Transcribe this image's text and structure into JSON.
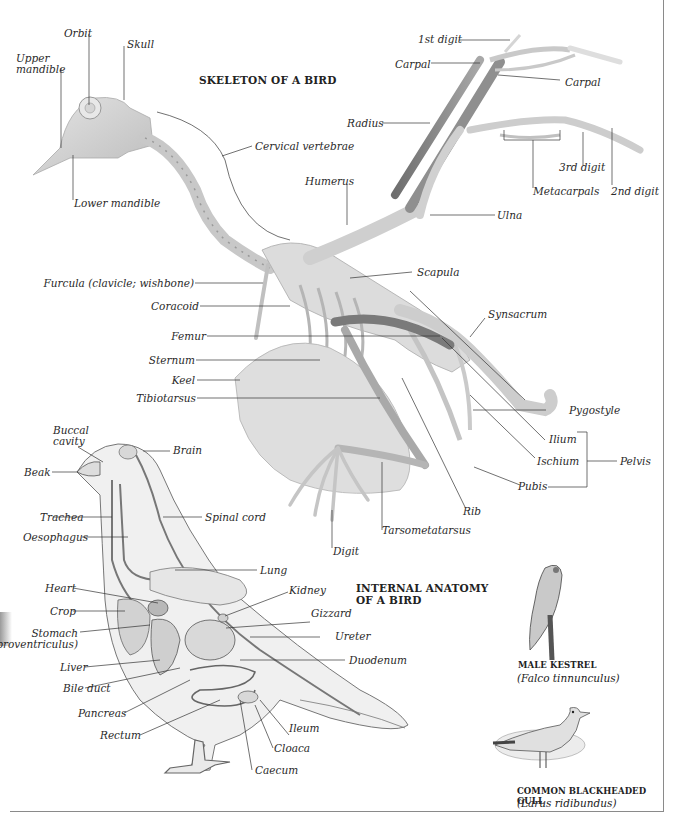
{
  "skeleton": {
    "title": "SKELETON OF A BIRD",
    "labels": {
      "orbit": "Orbit",
      "skull": "Skull",
      "upper_mandible_1": "Upper",
      "upper_mandible_2": "mandible",
      "lower_mandible": "Lower mandible",
      "cervical_vertebrae": "Cervical vertebrae",
      "humerus": "Humerus",
      "first_digit": "1st digit",
      "carpal_left": "Carpal",
      "carpal_right": "Carpal",
      "radius": "Radius",
      "third_digit": "3rd digit",
      "metacarpals": "Metacarpals",
      "second_digit": "2nd digit",
      "ulna": "Ulna",
      "furcula": "Furcula (clavicle; wishbone)",
      "coracoid": "Coracoid",
      "scapula": "Scapula",
      "synsacrum": "Synsacrum",
      "femur": "Femur",
      "sternum": "Sternum",
      "keel": "Keel",
      "tibiotarsus": "Tibiotarsus",
      "pygostyle": "Pygostyle",
      "ilium": "Ilium",
      "ischium": "Ischium",
      "pelvis": "Pelvis",
      "pubis": "Pubis",
      "rib": "Rib",
      "tarsometatarsus": "Tarsometatarsus",
      "digit": "Digit"
    }
  },
  "internal": {
    "title_line1": "INTERNAL ANATOMY",
    "title_line2": "OF A BIRD",
    "labels": {
      "buccal_cavity_1": "Buccal",
      "buccal_cavity_2": "cavity",
      "brain": "Brain",
      "beak": "Beak",
      "trachea": "Trachea",
      "spinal_cord": "Spinal cord",
      "oesophagus": "Oesophagus",
      "lung": "Lung",
      "heart": "Heart",
      "kidney": "Kidney",
      "crop": "Crop",
      "gizzard": "Gizzard",
      "stomach_1": "Stomach",
      "stomach_2": "(proventriculus)",
      "ureter": "Ureter",
      "liver": "Liver",
      "duodenum": "Duodenum",
      "bile_duct": "Bile duct",
      "pancreas": "Pancreas",
      "ileum": "Ileum",
      "rectum": "Rectum",
      "cloaca": "Cloaca",
      "caecum": "Caecum"
    }
  },
  "species": [
    {
      "name": "MALE KESTREL",
      "latin": "(Falco tinnunculus)"
    },
    {
      "name": "COMMON BLACKHEADED GULL",
      "latin": "(Larus ridibundus)"
    }
  ]
}
